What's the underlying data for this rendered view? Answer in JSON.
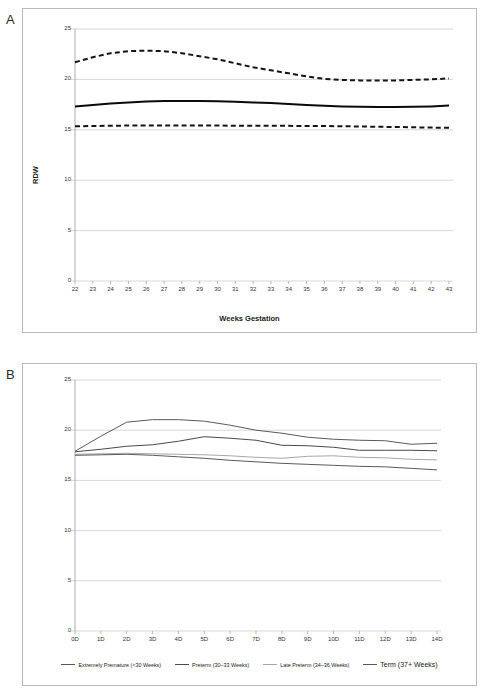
{
  "figure": {
    "panel_a_letter": "A",
    "panel_b_letter": "B"
  },
  "chart_data": [
    {
      "panel": "A",
      "type": "line",
      "title": "",
      "xlabel": "Weeks Gestation",
      "ylabel": "RDW",
      "xlim": [
        22,
        43
      ],
      "ylim": [
        0,
        25
      ],
      "yticks": [
        0,
        5,
        10,
        15,
        20,
        25
      ],
      "grid": true,
      "legend_position": "none",
      "categories": [
        "22",
        "23",
        "24",
        "25",
        "26",
        "27",
        "28",
        "29",
        "30",
        "31",
        "32",
        "33",
        "34",
        "35",
        "36",
        "37",
        "38",
        "39",
        "40",
        "41",
        "42",
        "43"
      ],
      "series": [
        {
          "name": "Upper reference limit",
          "style": "dashed",
          "color": "#141414",
          "values": [
            21.7,
            22.2,
            22.6,
            22.8,
            22.85,
            22.8,
            22.6,
            22.3,
            22.0,
            21.6,
            21.2,
            20.9,
            20.6,
            20.3,
            20.05,
            19.95,
            19.9,
            19.88,
            19.9,
            19.95,
            20.0,
            20.1
          ]
        },
        {
          "name": "Mean",
          "style": "solid",
          "color": "#0a0a0a",
          "values": [
            17.3,
            17.45,
            17.6,
            17.7,
            17.8,
            17.85,
            17.85,
            17.85,
            17.82,
            17.78,
            17.72,
            17.65,
            17.55,
            17.45,
            17.38,
            17.32,
            17.28,
            17.25,
            17.25,
            17.28,
            17.32,
            17.4
          ]
        },
        {
          "name": "Lower reference limit",
          "style": "dashed",
          "color": "#141414",
          "values": [
            15.35,
            15.38,
            15.4,
            15.42,
            15.43,
            15.43,
            15.43,
            15.42,
            15.42,
            15.41,
            15.4,
            15.4,
            15.39,
            15.38,
            15.37,
            15.35,
            15.33,
            15.3,
            15.28,
            15.25,
            15.22,
            15.2
          ]
        }
      ]
    },
    {
      "panel": "B",
      "type": "line",
      "title": "",
      "xlabel": "",
      "ylabel": "",
      "xlim": [
        0,
        14
      ],
      "ylim": [
        0,
        25
      ],
      "yticks": [
        0,
        5,
        10,
        15,
        20,
        25
      ],
      "grid": true,
      "legend_position": "bottom",
      "categories": [
        "0D",
        "1D",
        "2D",
        "3D",
        "4D",
        "5D",
        "6D",
        "7D",
        "8D",
        "9D",
        "10D",
        "11D",
        "12D",
        "13D",
        "14D"
      ],
      "series": [
        {
          "name": "Extremely Premature (<30 Weeks)",
          "style": "solid",
          "color": "#5a5a5a",
          "values": [
            17.9,
            19.4,
            20.8,
            21.05,
            21.05,
            20.9,
            20.5,
            20.0,
            19.7,
            19.3,
            19.1,
            19.0,
            18.95,
            18.6,
            18.7
          ]
        },
        {
          "name": "Preterm (30–33 Weeks)",
          "style": "solid",
          "color": "#4a4a4a",
          "values": [
            17.85,
            18.1,
            18.4,
            18.55,
            18.9,
            19.35,
            19.2,
            19.0,
            18.5,
            18.45,
            18.3,
            18.0,
            18.0,
            18.0,
            17.95
          ]
        },
        {
          "name": "Late Preterm (34–36 Weeks)",
          "style": "solid",
          "color": "#a8a8a8",
          "values": [
            17.6,
            17.65,
            17.7,
            17.65,
            17.6,
            17.55,
            17.45,
            17.3,
            17.2,
            17.4,
            17.45,
            17.3,
            17.25,
            17.1,
            17.05
          ]
        },
        {
          "name": "Term (37+ Weeks)",
          "style": "solid",
          "color": "#5a5a5a",
          "values": [
            17.5,
            17.55,
            17.6,
            17.5,
            17.35,
            17.2,
            17.0,
            16.85,
            16.7,
            16.6,
            16.5,
            16.4,
            16.35,
            16.2,
            16.05
          ]
        }
      ]
    }
  ]
}
